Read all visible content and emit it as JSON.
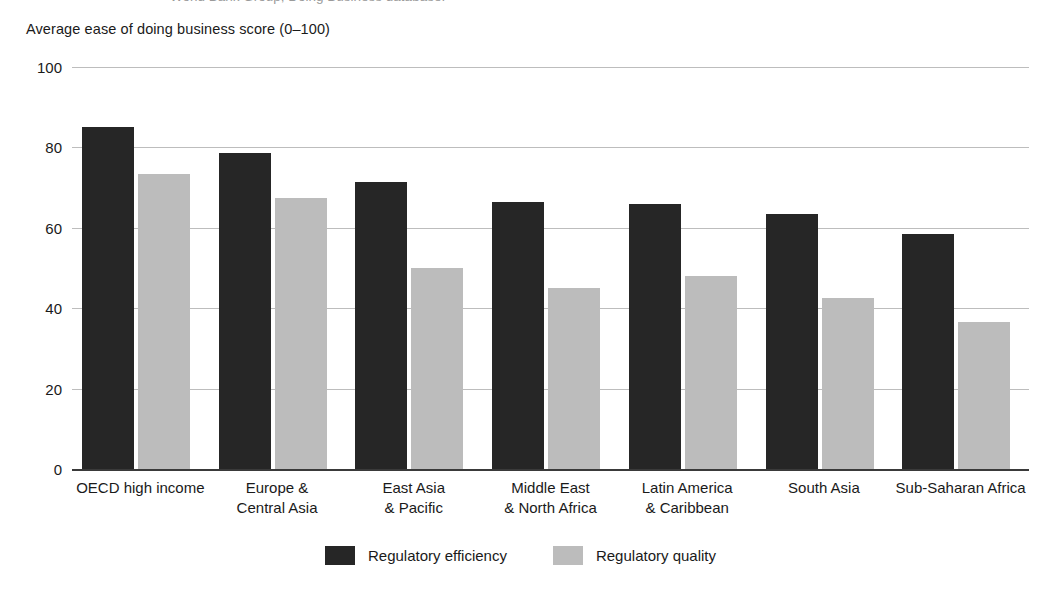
{
  "caption_sliver": "World Bank Group, Doing Business database.",
  "axis_title": "Average ease of doing business score (0–100)",
  "legend": {
    "items": [
      {
        "label": "Regulatory efficiency",
        "color": "#262626",
        "swatch_name": "legend-swatch-dark"
      },
      {
        "label": "Regulatory quality",
        "color": "#bcbcbc",
        "swatch_name": "legend-swatch-light"
      }
    ]
  },
  "chart_data": {
    "type": "bar",
    "title": "",
    "xlabel": "",
    "ylabel": "Average ease of doing business score (0–100)",
    "ylim": [
      0,
      100
    ],
    "yticks": [
      0,
      20,
      40,
      60,
      80,
      100
    ],
    "ytick_labels": [
      "0",
      "20",
      "40",
      "60",
      "80",
      "100"
    ],
    "grid": true,
    "legend_position": "bottom-center",
    "categories": [
      "OECD high income",
      "Europe &\nCentral Asia",
      "East Asia\n& Pacific",
      "Middle East\n& North Africa",
      "Latin America\n& Caribbean",
      "South Asia",
      "Sub-Saharan Africa"
    ],
    "series": [
      {
        "name": "Regulatory efficiency",
        "color": "#262626",
        "values": [
          85,
          78.5,
          71.5,
          66.5,
          66,
          63.5,
          58.5
        ]
      },
      {
        "name": "Regulatory quality",
        "color": "#bcbcbc",
        "values": [
          73.5,
          67.5,
          50,
          45,
          48,
          42.5,
          36.5
        ]
      }
    ]
  }
}
